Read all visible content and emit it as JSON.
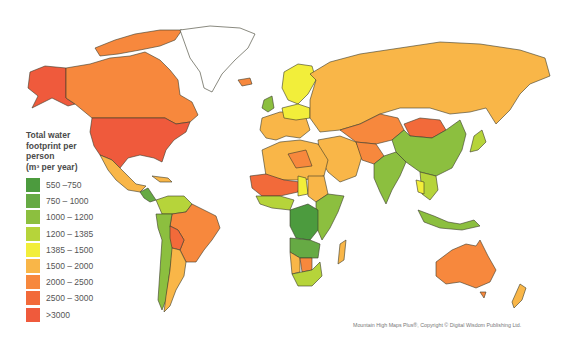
{
  "legend": {
    "title_lines": [
      "Total water",
      "footprint per",
      "person",
      "(m³ per year)"
    ],
    "items": [
      {
        "label": "550 –750",
        "color": "#4c9b3e"
      },
      {
        "label": "750 – 1000",
        "color": "#66aa44"
      },
      {
        "label": "1000 – 1200",
        "color": "#8cbf3f"
      },
      {
        "label": "1200 – 1385",
        "color": "#b6d43a"
      },
      {
        "label": "1385 – 1500",
        "color": "#f2ee3a"
      },
      {
        "label": "1500 – 2000",
        "color": "#f9b648"
      },
      {
        "label": "2000 – 2500",
        "color": "#f7883d"
      },
      {
        "label": "2500 – 3000",
        "color": "#f26a3a"
      },
      {
        "label": ">3000",
        "color": "#ef5a3c"
      }
    ]
  },
  "credit": "Mountain High Maps Plus®, Copyright © Digital Wisdom Publishing Ltd.",
  "regions": [
    {
      "name": "Alaska",
      "class": ">3000"
    },
    {
      "name": "Canada",
      "class": "2000 – 2500"
    },
    {
      "name": "Greenland",
      "class": "no data"
    },
    {
      "name": "United States",
      "class": ">3000"
    },
    {
      "name": "Mexico",
      "class": "1500 – 2000"
    },
    {
      "name": "Central America",
      "class": "750 – 1000"
    },
    {
      "name": "Colombia/Venezuela",
      "class": "1200 – 1385"
    },
    {
      "name": "Brazil",
      "class": "2000 – 2500"
    },
    {
      "name": "Bolivia",
      "class": "2500 – 3000"
    },
    {
      "name": "Argentina",
      "class": "1500 – 2000"
    },
    {
      "name": "Chile/Peru",
      "class": "1000 – 1200"
    },
    {
      "name": "Western Europe",
      "class": "1500 – 2000"
    },
    {
      "name": "Scandinavia",
      "class": "1385 – 1500"
    },
    {
      "name": "Russia",
      "class": "1500 – 2000"
    },
    {
      "name": "Kazakhstan",
      "class": "2000 – 2500"
    },
    {
      "name": "Mongolia",
      "class": "2500 – 3000"
    },
    {
      "name": "China",
      "class": "1000 – 1200"
    },
    {
      "name": "India",
      "class": "1000 – 1200"
    },
    {
      "name": "Middle East",
      "class": "1500 – 2000"
    },
    {
      "name": "North Africa",
      "class": "1500 – 2000"
    },
    {
      "name": "Sahel",
      "class": "2500 – 3000"
    },
    {
      "name": "Central Africa",
      "class": "550 –750"
    },
    {
      "name": "East Africa",
      "class": "1000 – 1200"
    },
    {
      "name": "Southern Africa",
      "class": "1200 – 1385"
    },
    {
      "name": "Madagascar",
      "class": "1500 – 2000"
    },
    {
      "name": "Southeast Asia",
      "class": "1000 – 1200"
    },
    {
      "name": "Japan",
      "class": "1200 – 1385"
    },
    {
      "name": "Australia",
      "class": "2000 – 2500"
    },
    {
      "name": "New Zealand",
      "class": "1500 – 2000"
    }
  ]
}
